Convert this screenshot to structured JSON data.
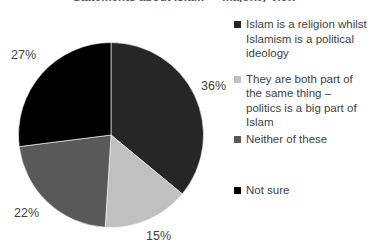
{
  "chart_data": {
    "type": "pie",
    "title": "Statements about Islam — majority view",
    "categories": [
      "Islam is a religion whilst Islamism is a political ideology",
      "They are both part of the same thing – politics is a big part of Islam",
      "Neither of these",
      "Not sure"
    ],
    "values": [
      36,
      22,
      15,
      27
    ],
    "display_order_clockwise_from_top": [
      {
        "label": "Islam is a religion whilst Islamism is a political ideology",
        "value": 36,
        "data_label": "36%",
        "color": "#262626"
      },
      {
        "label": "They are both part of the same thing – politics is a big part of Islam",
        "value": 15,
        "data_label": "15%",
        "color": "#c0c0c0"
      },
      {
        "label": "Neither of these",
        "value": 22,
        "data_label": "22%",
        "color": "#595959"
      },
      {
        "label": "Not sure",
        "value": 27,
        "data_label": "27%",
        "color": "#000000"
      }
    ],
    "data_labels": [
      "36%",
      "15%",
      "22%",
      "27%"
    ],
    "colors": [
      "#262626",
      "#c0c0c0",
      "#595959",
      "#000000"
    ],
    "legend_position": "right",
    "xlabel": "",
    "ylabel": "",
    "grid": false
  },
  "legend": {
    "items": [
      {
        "label": "Islam is a religion whilst Islamism is a political ideology",
        "color": "#262626"
      },
      {
        "label": "They are both part of the same thing – politics is a big part of Islam",
        "color": "#c0c0c0"
      },
      {
        "label": "Neither of these",
        "color": "#595959"
      },
      {
        "label": "Not sure",
        "color": "#000000"
      }
    ]
  }
}
